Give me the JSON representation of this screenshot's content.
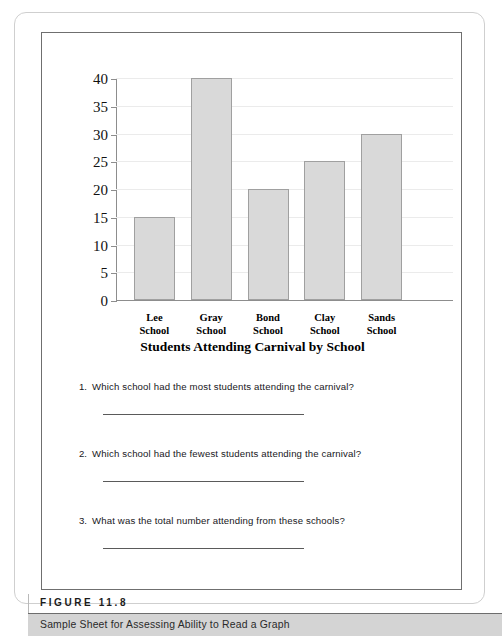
{
  "figure": {
    "label": "FIGURE 11.8",
    "caption": "Sample Sheet for Assessing Ability to Read a Graph"
  },
  "worksheet": {
    "title": "Students Attending Carnival by School",
    "questions": [
      {
        "number": "1.",
        "text": "Which school had the most students attending the carnival?",
        "answer": ""
      },
      {
        "number": "2.",
        "text": "Which school had the fewest students attending the carnival?",
        "answer": ""
      },
      {
        "number": "3.",
        "text": "What was the total number attending from these schools?",
        "answer": ""
      }
    ]
  },
  "colors": {
    "bar_fill": "#d9d9d9",
    "bar_stroke": "#a0a0a0",
    "axis": "#8d8d8d",
    "gridline": "#ebebeb",
    "caption_band": "#d4d4d4",
    "frame": "#6f6f6f"
  },
  "chart_data": {
    "type": "bar",
    "title": "Students Attending Carnival by School",
    "xlabel": "",
    "ylabel": "",
    "categories": [
      "Lee School",
      "Gray School",
      "Bond School",
      "Clay School",
      "Sands School"
    ],
    "category_lines": [
      [
        "Lee",
        "School"
      ],
      [
        "Gray",
        "School"
      ],
      [
        "Bond",
        "School"
      ],
      [
        "Clay",
        "School"
      ],
      [
        "Sands",
        "School"
      ]
    ],
    "values": [
      15,
      40,
      20,
      25,
      30
    ],
    "ylim": [
      0,
      40
    ],
    "yticks": [
      0,
      5,
      10,
      15,
      20,
      25,
      30,
      35,
      40
    ],
    "ytick_labels": [
      "0",
      "5",
      "10",
      "15",
      "20",
      "25",
      "30",
      "35",
      "40"
    ],
    "grid": true,
    "legend": false
  }
}
